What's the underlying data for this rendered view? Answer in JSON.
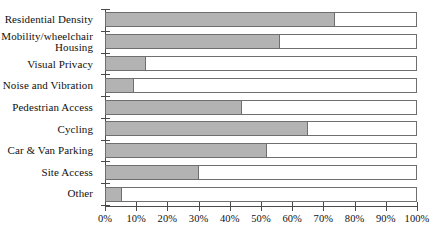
{
  "chart_data": {
    "type": "bar",
    "orientation": "horizontal",
    "title": "",
    "subtitle": "",
    "xlabel": "",
    "ylabel": "",
    "xlim": [
      0,
      100
    ],
    "grid": false,
    "legend": null,
    "categories": [
      "Residential Density",
      "Mobility/wheelchair\nHousing",
      "Visual Privacy",
      "Noise and Vibration",
      "Pedestrian Access",
      "Cycling",
      "Car & Van Parking",
      "Site Access",
      "Other"
    ],
    "values": [
      74,
      56,
      13,
      9,
      44,
      65,
      52,
      30,
      5
    ],
    "value_unit": "%",
    "bar_max": 100,
    "xticks": [
      0,
      10,
      20,
      30,
      40,
      50,
      60,
      70,
      80,
      90,
      100
    ],
    "xtick_labels": [
      "0%",
      "10%",
      "20%",
      "30%",
      "40%",
      "50%",
      "60%",
      "70%",
      "80%",
      "90%",
      "100%"
    ],
    "colors": {
      "bar_fill": "#b3b3b3",
      "bar_outline": "#6f6f6f",
      "bar_background": "#ffffff",
      "axis": "#4a4a4a",
      "text": "#111111",
      "canvas": "#ffffff"
    }
  }
}
